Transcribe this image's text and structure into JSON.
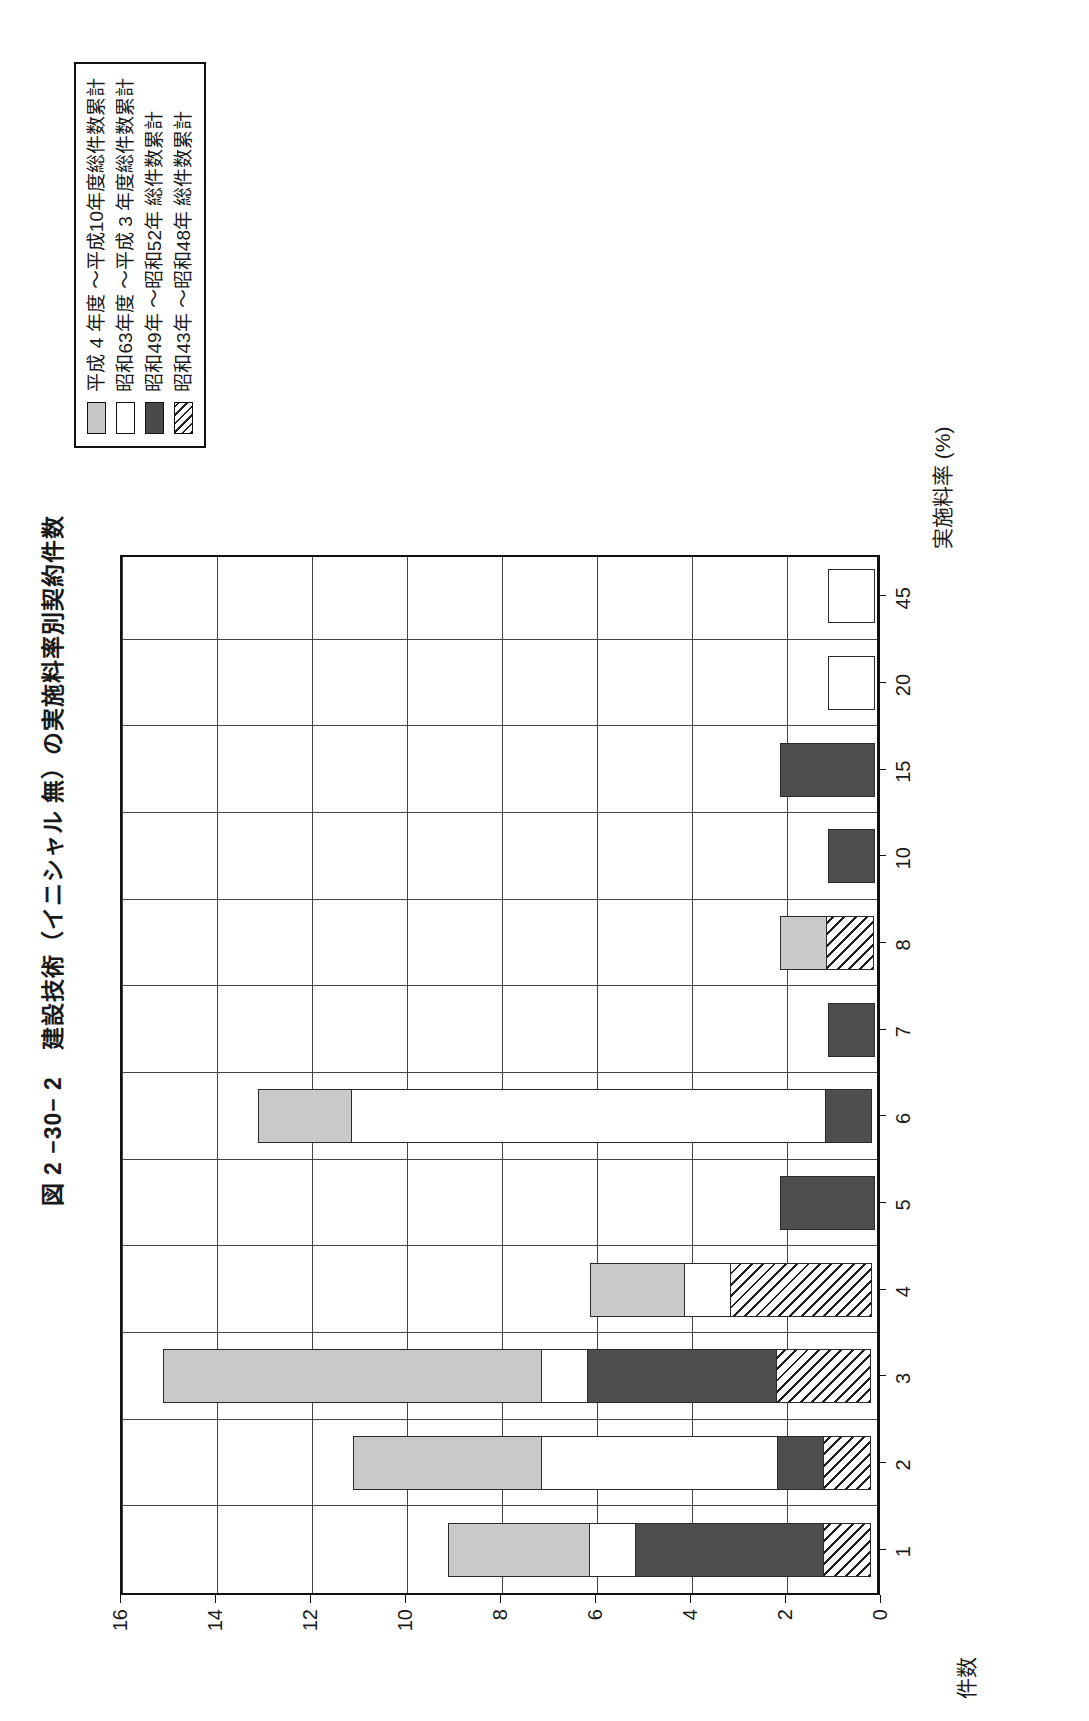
{
  "figure": {
    "number": "図 2 −30− 2",
    "title": "建設技術（イニシャル 無）の実施料率別契約件数",
    "title_full": "図 2 −30− 2　建設技術（イニシャル 無）の実施料率別契約件数"
  },
  "legend": {
    "position": "top-right",
    "items": [
      {
        "swatch": "light-gray-swatch",
        "label": "平成 4 年度 ～平成10年度総件数累計",
        "color": "#c6c6c6",
        "pattern": "solid-light-gray"
      },
      {
        "swatch": "white-swatch",
        "label": "昭和63年度 ～平成 3 年度総件数累計",
        "color": "#ffffff",
        "pattern": "solid-white"
      },
      {
        "swatch": "dark-swatch",
        "label": "昭和49年 ～昭和52年 総件数累計",
        "color": "#4a4a4a",
        "pattern": "solid-dark"
      },
      {
        "swatch": "hatch-swatch",
        "label": "昭和43年 ～昭和48年 総件数累計",
        "color": "#ffffff",
        "pattern": "diagonal-hatch"
      }
    ]
  },
  "chart_data": {
    "type": "bar",
    "orientation": "vertical-stacked",
    "title": "建設技術（イニシャル 無）の実施料率別契約件数",
    "xlabel": "実施料率 (%)",
    "ylabel": "件数",
    "categories": [
      "1",
      "2",
      "3",
      "4",
      "5",
      "6",
      "7",
      "8",
      "10",
      "15",
      "20",
      "45"
    ],
    "ylim": [
      0,
      16
    ],
    "yticks": [
      0,
      2,
      4,
      6,
      8,
      10,
      12,
      14,
      16
    ],
    "grid": true,
    "legend_position": "top-right",
    "series": [
      {
        "name": "昭和43年 ～昭和48年 総件数累計",
        "pattern": "diagonal-hatch",
        "values": [
          1,
          1,
          2,
          3,
          0,
          0,
          0,
          1,
          0,
          0,
          0,
          0
        ]
      },
      {
        "name": "昭和49年 ～昭和52年 総件数累計",
        "pattern": "solid-dark",
        "values": [
          4,
          1,
          4,
          0,
          2,
          1,
          1,
          0,
          1,
          2,
          0,
          0
        ]
      },
      {
        "name": "昭和63年度 ～平成 3 年度総件数累計",
        "pattern": "solid-white",
        "values": [
          1,
          5,
          1,
          1,
          0,
          10,
          0,
          0,
          0,
          0,
          1,
          1
        ]
      },
      {
        "name": "平成 4 年度 ～平成10年度総件数累計",
        "pattern": "solid-light-gray",
        "values": [
          3,
          4,
          8,
          2,
          0,
          2,
          0,
          1,
          0,
          0,
          0,
          0
        ]
      }
    ],
    "totals": [
      9,
      11,
      15,
      6,
      2,
      13,
      1,
      2,
      1,
      2,
      1,
      1
    ]
  }
}
